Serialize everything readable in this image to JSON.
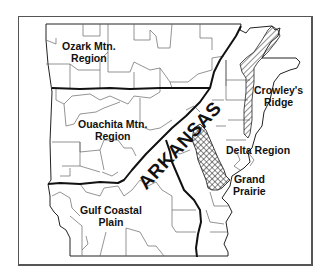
{
  "map": {
    "state_name": "ARKANSAS",
    "regions": [
      {
        "id": "ozark",
        "line1": "Ozark Mtn.",
        "line2": "Region"
      },
      {
        "id": "ouachita",
        "line1": "Ouachita Mtn.",
        "line2": "Region"
      },
      {
        "id": "crowleys",
        "line1": "Crowley's",
        "line2": "Ridge"
      },
      {
        "id": "delta",
        "line1": "Delta Region",
        "line2": ""
      },
      {
        "id": "grand_prairie",
        "line1": "Grand",
        "line2": "Prairie"
      },
      {
        "id": "gulf",
        "line1": "Gulf Coastal",
        "line2": "Plain"
      }
    ],
    "colors": {
      "border": "#111111",
      "county": "#555555",
      "background": "#ffffff"
    }
  }
}
